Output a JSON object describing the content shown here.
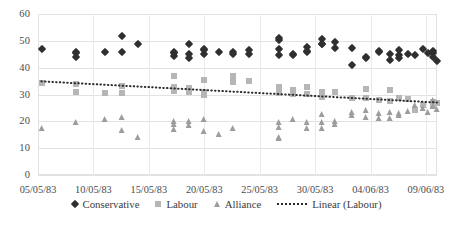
{
  "chart_data": {
    "type": "scatter",
    "title": "",
    "xlabel": "",
    "ylabel": "",
    "ylim": [
      0,
      60
    ],
    "ytick_labels": [
      "0",
      "10",
      "20",
      "30",
      "40",
      "50",
      "60"
    ],
    "yticks": [
      0,
      10,
      20,
      30,
      40,
      50,
      60
    ],
    "grid": true,
    "legend_position": "bottom",
    "x_axis_type": "date",
    "x_start": "05/05/83",
    "x_end": "09/06/83",
    "xtick_labels": [
      "05/05/83",
      "10/05/83",
      "15/05/83",
      "20/05/83",
      "25/05/83",
      "30/05/83",
      "04/06/83",
      "09/06/83"
    ],
    "xtick_days": [
      0,
      5,
      10,
      15,
      20,
      25,
      30,
      35
    ],
    "x_total_days": 36,
    "series": [
      {
        "name": "Conservative",
        "marker": "diamond",
        "color": "#2f2f2f",
        "points": [
          [
            0.4,
            47.0
          ],
          [
            3.4,
            45.5
          ],
          [
            3.4,
            44.0
          ],
          [
            3.4,
            46.0
          ],
          [
            6.0,
            46.0
          ],
          [
            7.6,
            51.7
          ],
          [
            7.6,
            46.0
          ],
          [
            9.0,
            49.0
          ],
          [
            12.3,
            45.5
          ],
          [
            12.3,
            44.5
          ],
          [
            12.3,
            46.0
          ],
          [
            13.6,
            49.0
          ],
          [
            13.6,
            45.0
          ],
          [
            13.6,
            43.5
          ],
          [
            15.0,
            47.0
          ],
          [
            15.0,
            45.0
          ],
          [
            15.0,
            46.5
          ],
          [
            16.3,
            46.0
          ],
          [
            17.6,
            46.0
          ],
          [
            17.6,
            45.0
          ],
          [
            19.0,
            46.5
          ],
          [
            19.0,
            45.0
          ],
          [
            21.7,
            51.0
          ],
          [
            21.7,
            50.3
          ],
          [
            21.7,
            47.0
          ],
          [
            21.7,
            44.7
          ],
          [
            23.0,
            45.0
          ],
          [
            23.0,
            44.8
          ],
          [
            24.3,
            47.7
          ],
          [
            24.3,
            46.3
          ],
          [
            24.3,
            45.8
          ],
          [
            25.6,
            50.5
          ],
          [
            25.6,
            49.0
          ],
          [
            25.6,
            48.8
          ],
          [
            26.8,
            49.7
          ],
          [
            26.8,
            47.3
          ],
          [
            28.3,
            47.3
          ],
          [
            28.3,
            41.0
          ],
          [
            29.6,
            44.0
          ],
          [
            29.6,
            43.7
          ],
          [
            30.8,
            46.3
          ],
          [
            30.8,
            45.8
          ],
          [
            31.8,
            45.0
          ],
          [
            31.8,
            43.0
          ],
          [
            32.6,
            46.7
          ],
          [
            32.6,
            44.7
          ],
          [
            32.6,
            43.7
          ],
          [
            33.4,
            45.0
          ],
          [
            34.0,
            44.8
          ],
          [
            34.7,
            46.8
          ],
          [
            35.2,
            45.5
          ],
          [
            35.6,
            46.3
          ],
          [
            35.6,
            45.5
          ],
          [
            35.6,
            44.0
          ],
          [
            36.0,
            42.3
          ]
        ]
      },
      {
        "name": "Labour",
        "marker": "square",
        "color": "#b6b6b6",
        "points": [
          [
            0.4,
            34.3
          ],
          [
            3.4,
            34.0
          ],
          [
            3.4,
            30.8
          ],
          [
            6.0,
            30.7
          ],
          [
            7.6,
            33.3
          ],
          [
            7.6,
            30.7
          ],
          [
            12.3,
            37.0
          ],
          [
            12.3,
            32.7
          ],
          [
            12.3,
            31.3
          ],
          [
            13.6,
            32.3
          ],
          [
            13.6,
            31.0
          ],
          [
            15.0,
            35.3
          ],
          [
            15.0,
            31.0
          ],
          [
            15.0,
            29.7
          ],
          [
            17.6,
            37.0
          ],
          [
            17.6,
            34.7
          ],
          [
            19.0,
            35.0
          ],
          [
            21.7,
            32.7
          ],
          [
            21.7,
            30.7
          ],
          [
            23.0,
            31.7
          ],
          [
            23.0,
            30.3
          ],
          [
            24.3,
            32.7
          ],
          [
            24.3,
            30.3
          ],
          [
            25.6,
            31.0
          ],
          [
            25.6,
            29.0
          ],
          [
            26.8,
            31.0
          ],
          [
            28.3,
            28.7
          ],
          [
            29.6,
            32.0
          ],
          [
            29.6,
            28.7
          ],
          [
            30.8,
            28.0
          ],
          [
            31.8,
            31.7
          ],
          [
            31.8,
            27.7
          ],
          [
            32.6,
            28.7
          ],
          [
            33.4,
            28.3
          ],
          [
            34.0,
            24.3
          ],
          [
            34.7,
            26.0
          ],
          [
            35.6,
            27.3
          ],
          [
            35.6,
            26.0
          ],
          [
            36.0,
            27.0
          ]
        ]
      },
      {
        "name": "Alliance",
        "marker": "triangle",
        "color": "#9d9d9d",
        "points": [
          [
            0.4,
            17.7
          ],
          [
            3.4,
            19.8
          ],
          [
            6.0,
            21.0
          ],
          [
            7.6,
            21.7
          ],
          [
            7.6,
            16.7
          ],
          [
            9.0,
            14.0
          ],
          [
            12.3,
            20.3
          ],
          [
            12.3,
            19.0
          ],
          [
            12.3,
            17.0
          ],
          [
            13.6,
            20.3
          ],
          [
            13.6,
            18.7
          ],
          [
            15.0,
            21.0
          ],
          [
            15.0,
            16.3
          ],
          [
            16.3,
            15.3
          ],
          [
            17.6,
            17.7
          ],
          [
            21.7,
            19.7
          ],
          [
            21.7,
            18.0
          ],
          [
            21.7,
            14.0
          ],
          [
            21.7,
            13.7
          ],
          [
            23.0,
            21.0
          ],
          [
            24.3,
            19.7
          ],
          [
            24.3,
            17.7
          ],
          [
            25.6,
            22.7
          ],
          [
            25.6,
            19.7
          ],
          [
            25.6,
            17.7
          ],
          [
            26.8,
            20.3
          ],
          [
            26.8,
            19.0
          ],
          [
            28.3,
            23.3
          ],
          [
            28.3,
            22.3
          ],
          [
            29.6,
            24.3
          ],
          [
            29.6,
            21.7
          ],
          [
            30.8,
            23.0
          ],
          [
            30.8,
            21.3
          ],
          [
            31.8,
            23.3
          ],
          [
            31.8,
            21.3
          ],
          [
            32.6,
            23.0
          ],
          [
            32.6,
            22.3
          ],
          [
            33.4,
            23.7
          ],
          [
            34.0,
            26.0
          ],
          [
            34.7,
            25.0
          ],
          [
            35.2,
            23.3
          ],
          [
            35.6,
            28.0
          ],
          [
            35.6,
            25.7
          ],
          [
            36.0,
            24.7
          ]
        ]
      }
    ],
    "trendline": {
      "name": "Linear (Labour)",
      "style": "dotted",
      "color": "#2b2b2b",
      "x_start": 0.3,
      "x_end": 36.0,
      "y_start": 34.9,
      "y_end": 27.0
    }
  },
  "legend": {
    "items": [
      {
        "label": "Conservative",
        "marker": "diamond-icon"
      },
      {
        "label": "Labour",
        "marker": "square-icon"
      },
      {
        "label": "Alliance",
        "marker": "triangle-icon"
      },
      {
        "label": "Linear (Labour)",
        "marker": "dotted-line-icon"
      }
    ]
  }
}
